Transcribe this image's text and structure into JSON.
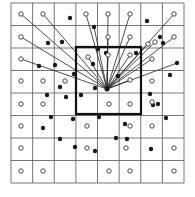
{
  "figure": {
    "colors": {
      "background": "#ffffff",
      "grid": "#555555",
      "line": "#222222",
      "bold_box": "#111111",
      "filled": "#1a1a1a",
      "hollow_stroke": "#333333"
    },
    "grid": {
      "x0": 11,
      "y0": 3,
      "x1": 184,
      "y1": 183,
      "cols": 8,
      "rows": 8
    },
    "bold_box": {
      "x": 76,
      "y": 47,
      "w": 65,
      "h": 67
    },
    "center": {
      "x": 107,
      "y": 89
    },
    "hollow_points": [
      [
        21,
        14
      ],
      [
        43,
        14
      ],
      [
        86,
        14
      ],
      [
        108,
        14
      ],
      [
        130,
        14
      ],
      [
        174,
        14
      ],
      [
        21,
        37
      ],
      [
        108,
        37
      ],
      [
        130,
        37
      ],
      [
        174,
        37
      ],
      [
        155,
        42
      ],
      [
        148,
        44
      ],
      [
        21,
        59
      ],
      [
        88,
        57
      ],
      [
        108,
        55
      ],
      [
        130,
        55
      ],
      [
        152,
        59
      ],
      [
        21,
        81
      ],
      [
        43,
        81
      ],
      [
        65,
        81
      ],
      [
        152,
        81
      ],
      [
        130,
        80
      ],
      [
        21,
        104
      ],
      [
        43,
        104
      ],
      [
        109,
        104
      ],
      [
        130,
        104
      ],
      [
        152,
        102
      ],
      [
        21,
        126
      ],
      [
        87,
        126
      ],
      [
        130,
        126
      ],
      [
        152,
        126
      ],
      [
        21,
        148
      ],
      [
        87,
        148
      ],
      [
        126,
        148
      ],
      [
        174,
        148
      ],
      [
        21,
        171
      ],
      [
        43,
        171
      ],
      [
        109,
        171
      ],
      [
        130,
        171
      ],
      [
        174,
        171
      ]
    ],
    "filled_points": [
      [
        70,
        18
      ],
      [
        147,
        21
      ],
      [
        94,
        27
      ],
      [
        48,
        43
      ],
      [
        62,
        42
      ],
      [
        160,
        37
      ],
      [
        163,
        43
      ],
      [
        98,
        49
      ],
      [
        106,
        53
      ],
      [
        136,
        53
      ],
      [
        39,
        66
      ],
      [
        55,
        65
      ],
      [
        93,
        64
      ],
      [
        177,
        63
      ],
      [
        74,
        74
      ],
      [
        118,
        76
      ],
      [
        60,
        87
      ],
      [
        47,
        95
      ],
      [
        95,
        88
      ],
      [
        170,
        75
      ],
      [
        66,
        97
      ],
      [
        81,
        95
      ],
      [
        150,
        94
      ],
      [
        158,
        104
      ],
      [
        51,
        117
      ],
      [
        73,
        119
      ],
      [
        99,
        117
      ],
      [
        153,
        105
      ],
      [
        166,
        118
      ],
      [
        43,
        128
      ],
      [
        60,
        139
      ],
      [
        125,
        124
      ],
      [
        116,
        138
      ],
      [
        127,
        139
      ],
      [
        75,
        147
      ],
      [
        95,
        151
      ],
      [
        151,
        149
      ]
    ],
    "connected_points": [
      [
        21,
        14
      ],
      [
        43,
        14
      ],
      [
        86,
        14
      ],
      [
        108,
        14
      ],
      [
        130,
        14
      ],
      [
        174,
        14
      ],
      [
        21,
        37
      ],
      [
        108,
        37
      ],
      [
        130,
        37
      ],
      [
        174,
        37
      ],
      [
        155,
        42
      ],
      [
        148,
        44
      ],
      [
        21,
        59
      ],
      [
        88,
        57
      ],
      [
        108,
        55
      ],
      [
        130,
        55
      ],
      [
        152,
        59
      ],
      [
        130,
        80
      ],
      [
        94,
        27
      ],
      [
        177,
        63
      ]
    ]
  }
}
